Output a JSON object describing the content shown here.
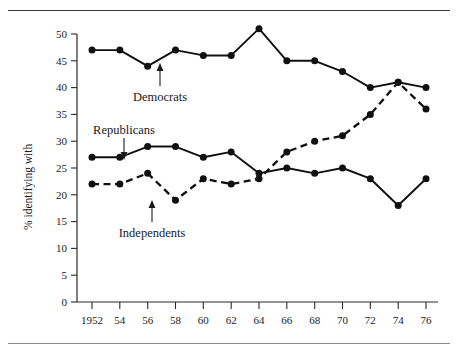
{
  "figure": {
    "has_top_rule": true,
    "has_bottom_rule": true
  },
  "chart_data": {
    "type": "line",
    "title": "",
    "xlabel": "",
    "ylabel": "% identifying with",
    "x": [
      1952,
      1954,
      1956,
      1958,
      1960,
      1962,
      1964,
      1966,
      1968,
      1970,
      1972,
      1974,
      1976
    ],
    "categories": [
      "1952",
      "54",
      "56",
      "58",
      "60",
      "62",
      "64",
      "66",
      "68",
      "70",
      "72",
      "74",
      "76"
    ],
    "xlim": [
      1951,
      1977
    ],
    "ylim": [
      0,
      52
    ],
    "yticks": [
      0,
      5,
      10,
      15,
      20,
      25,
      30,
      35,
      40,
      45,
      50
    ],
    "ytick_labels": [
      "0",
      "5",
      "10",
      "15",
      "20",
      "25",
      "30",
      "35",
      "40",
      "45",
      "50"
    ],
    "grid": false,
    "legend": "inline-annotations",
    "series": [
      {
        "name": "Democrats",
        "style": "solid",
        "marker": "filled-circle",
        "values": [
          47,
          47,
          44,
          47,
          46,
          46,
          51,
          45,
          45,
          43,
          40,
          41,
          40
        ]
      },
      {
        "name": "Republicans",
        "style": "solid",
        "marker": "filled-circle",
        "values": [
          27,
          27,
          29,
          29,
          27,
          28,
          24,
          25,
          24,
          25,
          23,
          18,
          23
        ]
      },
      {
        "name": "Independents",
        "style": "dashed",
        "marker": "filled-circle",
        "values": [
          22,
          22,
          24,
          19,
          23,
          22,
          23,
          28,
          30,
          31,
          35,
          41,
          36
        ]
      }
    ],
    "annotations": [
      {
        "text": "Democrats",
        "arrow": "up",
        "points_to_series": "Democrats"
      },
      {
        "text": "Republicans",
        "arrow": "down",
        "points_to_series": "Republicans"
      },
      {
        "text": "Independents",
        "arrow": "up",
        "points_to_series": "Independents"
      }
    ],
    "colors": {
      "line": "#101010",
      "axis": "#2b2b2b",
      "text": "#1a1a1a",
      "background": "#ffffff"
    }
  }
}
